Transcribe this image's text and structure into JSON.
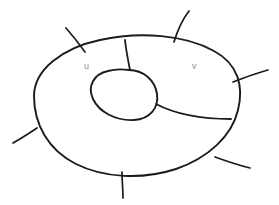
{
  "figure": {
    "background_color": "#ffffff",
    "ink_color": "#1b1b1b",
    "label_color": "#8d8d93",
    "width": 279,
    "height": 205
  },
  "labels": {
    "u": "u",
    "v": "v"
  },
  "shapes": {
    "outer_boundary": {
      "name": "outer-blob-boundary",
      "path": "M 34 96 C 34 70, 62 48, 100 40 C 140 31, 186 35, 214 51 C 238 64, 244 86, 238 110 C 232 136, 208 158, 176 169 C 142 180, 104 178, 76 164 C 48 150, 34 124, 34 96 Z"
    },
    "inner_boundary": {
      "name": "inner-hole-boundary",
      "path": "M 129 70 C 143 70, 155 80, 157 94 C 159 108, 150 119, 134 120 C 116 121, 99 112, 93 99 C 87 86, 94 74, 108 71 C 115 69, 122 69, 129 70 Z"
    },
    "chord_vertical": {
      "name": "chord-top-to-hole",
      "path": "M 125 40 C 126 50, 128 60, 130 70"
    },
    "chord_right": {
      "name": "chord-hole-to-right-edge",
      "path": "M 156 104 C 175 114, 200 119, 231 119"
    }
  },
  "whiskers": [
    {
      "name": "whisker-top-left",
      "path": "M 85 52 C 80 45, 73 36, 66 28"
    },
    {
      "name": "whisker-top-right",
      "path": "M 174 42 C 177 32, 182 20, 189 11"
    },
    {
      "name": "whisker-right",
      "path": "M 233 82 C 244 78, 256 73, 268 70"
    },
    {
      "name": "whisker-left",
      "path": "M 37 128 C 31 132, 22 138, 13 143"
    },
    {
      "name": "whisker-bottom",
      "path": "M 122 172 C 122 181, 123 190, 123 198"
    },
    {
      "name": "whisker-bottom-right",
      "path": "M 215 157 C 226 161, 238 165, 250 168"
    }
  ]
}
